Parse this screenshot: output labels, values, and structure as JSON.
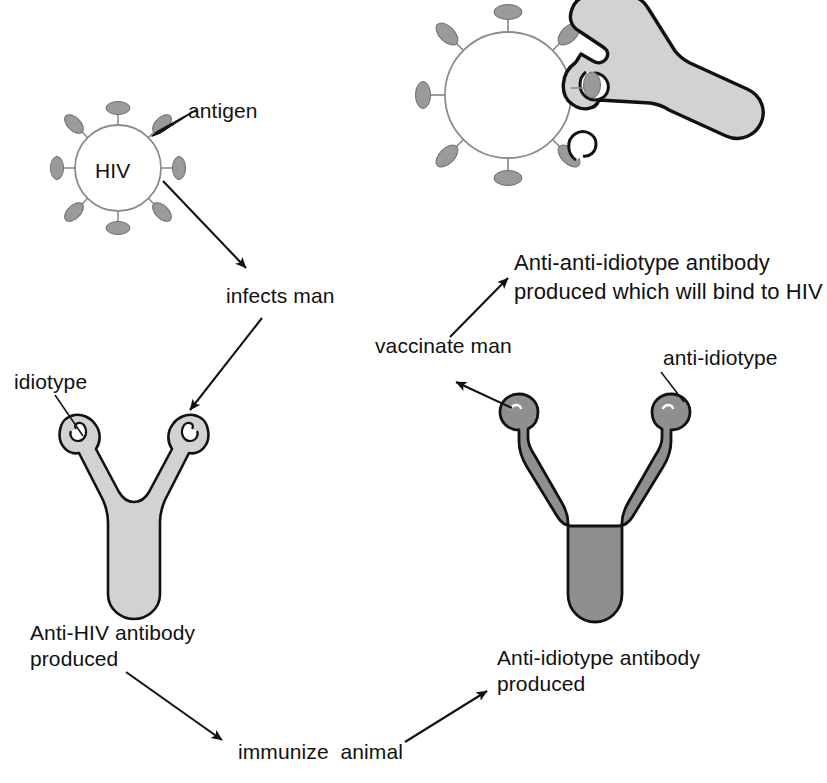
{
  "figure": {
    "kind": "immunology-schematic",
    "topic": "HIV anti-idiotype antibody vaccine concept"
  },
  "colors": {
    "background": "#ffffff",
    "ink": "#000000",
    "text": "#111111",
    "virus_outline": "#8c8c8c",
    "spike_fill": "#9a9a9a",
    "spike_outline": "#6f6f6f",
    "antibody_light_fill": "#d2d2d2",
    "antibody_light_outline": "#111111",
    "antibody_dark_fill": "#8f8f8f",
    "antibody_dark_outline": "#111111",
    "arrow": "#111111"
  },
  "labels": {
    "virus_core": "HIV",
    "antigen": "antigen",
    "infects_man": "infects man",
    "idiotype": "idiotype",
    "anti_hiv_antibody": "Anti-HIV antibody\nproduced",
    "immunize_animal": "immunize  animal",
    "anti_idiotype_antibody": "Anti-idiotype antibody\nproduced",
    "anti_idiotype": "anti-idiotype",
    "vaccinate_man": "vaccinate man",
    "anti_anti_idiotype": "Anti-anti-idiotype antibody\nproduced which will bind to HIV"
  },
  "elements": {
    "virus_free": {
      "name": "HIV virion",
      "cx": 118,
      "cy": 168,
      "r": 43,
      "spike_count": 8,
      "core_label": "HIV"
    },
    "virus_bound": {
      "name": "HIV virion bound by antibody",
      "cx": 508,
      "cy": 95,
      "r": 63,
      "spike_count": 8
    },
    "antibody_anti_hiv": {
      "name": "Anti-HIV antibody",
      "shade": "light",
      "binding_site": "idiotype",
      "binding_site_shape": "hook"
    },
    "antibody_anti_idiotype": {
      "name": "Anti-idiotype antibody",
      "shade": "dark",
      "binding_site": "anti-idiotype",
      "binding_site_shape": "knob"
    },
    "antibody_bound": {
      "name": "Anti-anti-idiotype antibody bound to HIV",
      "shade": "light",
      "orientation": "rotated-90-right"
    }
  },
  "flow": [
    {
      "from": "HIV virion",
      "to": "infects man",
      "label": "infects man"
    },
    {
      "from": "infects man",
      "to": "Anti-HIV antibody produced",
      "label": ""
    },
    {
      "from": "Anti-HIV antibody produced",
      "to": "immunize animal",
      "label": "immunize  animal"
    },
    {
      "from": "immunize animal",
      "to": "Anti-idiotype antibody produced",
      "label": ""
    },
    {
      "from": "Anti-idiotype antibody",
      "to": "vaccinate man",
      "label": "vaccinate man"
    },
    {
      "from": "vaccinate man",
      "to": "Anti-anti-idiotype antibody produced which will bind to HIV",
      "label": ""
    }
  ],
  "leaders": [
    {
      "label": "antigen",
      "points_to": "spike on HIV virion"
    },
    {
      "label": "idiotype",
      "points_to": "binding hook of Anti-HIV antibody"
    },
    {
      "label": "anti-idiotype",
      "points_to": "knob tip of Anti-idiotype antibody"
    }
  ]
}
